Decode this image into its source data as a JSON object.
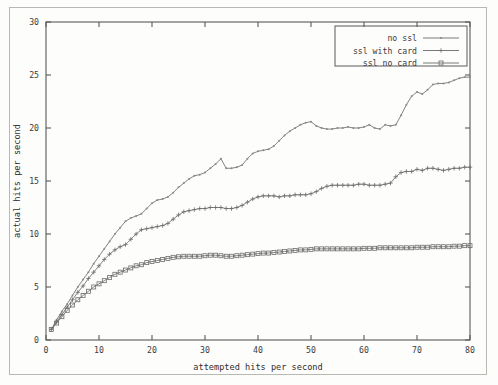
{
  "figure": {
    "background_color": "#fdfdfc",
    "border_color": "#b9b9b4",
    "axis_color": "#5a5a5a",
    "line_color": "#6b6b6b"
  },
  "chart_data": {
    "type": "line",
    "title": "",
    "xlabel": "attempted hits per second",
    "ylabel": "actual hits per second",
    "xlim": [
      0,
      80
    ],
    "ylim": [
      0,
      30
    ],
    "xticks": [
      0,
      10,
      20,
      30,
      40,
      50,
      60,
      70,
      80
    ],
    "yticks": [
      0,
      5,
      10,
      15,
      20,
      25,
      30
    ],
    "grid": false,
    "legend_position": "top-right",
    "legend": [
      "no ssl",
      "ssl with card",
      "ssl no card"
    ],
    "series": [
      {
        "name": "no ssl",
        "marker": "dot",
        "x": [
          1,
          2,
          3,
          4,
          5,
          6,
          7,
          8,
          9,
          10,
          11,
          12,
          13,
          14,
          15,
          16,
          17,
          18,
          19,
          20,
          21,
          22,
          23,
          24,
          25,
          26,
          27,
          28,
          29,
          30,
          31,
          32,
          33,
          34,
          35,
          36,
          37,
          38,
          39,
          40,
          41,
          42,
          43,
          44,
          45,
          46,
          47,
          48,
          49,
          50,
          51,
          52,
          53,
          54,
          55,
          56,
          57,
          58,
          59,
          60,
          61,
          62,
          63,
          64,
          65,
          66,
          67,
          68,
          69,
          70,
          71,
          72,
          73,
          74,
          75,
          76,
          77,
          78,
          79,
          80
        ],
        "y": [
          1.0,
          1.9,
          2.7,
          3.4,
          4.2,
          5.0,
          5.7,
          6.4,
          7.2,
          7.9,
          8.6,
          9.3,
          10.0,
          10.6,
          11.2,
          11.5,
          11.7,
          11.9,
          12.4,
          12.9,
          13.2,
          13.3,
          13.5,
          13.9,
          14.4,
          14.8,
          15.2,
          15.5,
          15.6,
          15.8,
          16.2,
          16.6,
          17.1,
          16.2,
          16.2,
          16.3,
          16.5,
          17.1,
          17.6,
          17.8,
          17.9,
          18.0,
          18.3,
          18.8,
          19.3,
          19.7,
          20.0,
          20.3,
          20.5,
          20.6,
          20.2,
          20.0,
          19.9,
          19.9,
          20.0,
          20.0,
          20.1,
          20.0,
          20.0,
          20.1,
          20.3,
          20.0,
          19.9,
          20.3,
          20.2,
          20.3,
          21.2,
          22.2,
          23.0,
          23.4,
          23.2,
          23.6,
          24.1,
          24.2,
          24.2,
          24.3,
          24.5,
          24.7,
          24.8,
          24.8
        ]
      },
      {
        "name": "ssl with card",
        "marker": "plus",
        "x": [
          1,
          2,
          3,
          4,
          5,
          6,
          7,
          8,
          9,
          10,
          11,
          12,
          13,
          14,
          15,
          16,
          17,
          18,
          19,
          20,
          21,
          22,
          23,
          24,
          25,
          26,
          27,
          28,
          29,
          30,
          31,
          32,
          33,
          34,
          35,
          36,
          37,
          38,
          39,
          40,
          41,
          42,
          43,
          44,
          45,
          46,
          47,
          48,
          49,
          50,
          51,
          52,
          53,
          54,
          55,
          56,
          57,
          58,
          59,
          60,
          61,
          62,
          63,
          64,
          65,
          66,
          67,
          68,
          69,
          70,
          71,
          72,
          73,
          74,
          75,
          76,
          77,
          78,
          79,
          80
        ],
        "y": [
          1.0,
          1.7,
          2.4,
          3.1,
          3.8,
          4.5,
          5.1,
          5.8,
          6.4,
          7.0,
          7.6,
          8.1,
          8.5,
          8.8,
          9.0,
          9.5,
          10.0,
          10.4,
          10.5,
          10.6,
          10.7,
          10.8,
          11.0,
          11.4,
          11.8,
          12.1,
          12.2,
          12.3,
          12.4,
          12.4,
          12.5,
          12.5,
          12.5,
          12.4,
          12.4,
          12.5,
          12.7,
          13.0,
          13.3,
          13.5,
          13.6,
          13.6,
          13.6,
          13.5,
          13.6,
          13.6,
          13.7,
          13.7,
          13.7,
          13.8,
          14.0,
          14.3,
          14.5,
          14.6,
          14.6,
          14.6,
          14.6,
          14.6,
          14.7,
          14.7,
          14.6,
          14.6,
          14.6,
          14.7,
          14.8,
          15.4,
          15.8,
          15.9,
          15.9,
          16.1,
          16.0,
          16.2,
          16.2,
          16.1,
          16.0,
          16.1,
          16.2,
          16.2,
          16.3,
          16.3
        ]
      },
      {
        "name": "ssl no card",
        "marker": "square",
        "x": [
          1,
          2,
          3,
          4,
          5,
          6,
          7,
          8,
          9,
          10,
          11,
          12,
          13,
          14,
          15,
          16,
          17,
          18,
          19,
          20,
          21,
          22,
          23,
          24,
          25,
          26,
          27,
          28,
          29,
          30,
          31,
          32,
          33,
          34,
          35,
          36,
          37,
          38,
          39,
          40,
          41,
          42,
          43,
          44,
          45,
          46,
          47,
          48,
          49,
          50,
          51,
          52,
          53,
          54,
          55,
          56,
          57,
          58,
          59,
          60,
          61,
          62,
          63,
          64,
          65,
          66,
          67,
          68,
          69,
          70,
          71,
          72,
          73,
          74,
          75,
          76,
          77,
          78,
          79,
          80
        ],
        "y": [
          1.0,
          1.6,
          2.2,
          2.8,
          3.3,
          3.8,
          4.2,
          4.6,
          5.0,
          5.3,
          5.6,
          5.9,
          6.2,
          6.4,
          6.6,
          6.8,
          7.0,
          7.1,
          7.3,
          7.4,
          7.5,
          7.6,
          7.7,
          7.8,
          7.85,
          7.9,
          7.9,
          7.9,
          7.9,
          7.95,
          8.0,
          8.0,
          7.95,
          7.9,
          7.9,
          7.95,
          8.0,
          8.05,
          8.1,
          8.15,
          8.2,
          8.2,
          8.25,
          8.3,
          8.35,
          8.4,
          8.45,
          8.5,
          8.5,
          8.55,
          8.6,
          8.6,
          8.6,
          8.6,
          8.6,
          8.6,
          8.6,
          8.6,
          8.6,
          8.65,
          8.65,
          8.65,
          8.7,
          8.7,
          8.7,
          8.7,
          8.7,
          8.7,
          8.7,
          8.75,
          8.75,
          8.75,
          8.8,
          8.8,
          8.8,
          8.8,
          8.85,
          8.85,
          8.9,
          8.9
        ]
      }
    ]
  }
}
